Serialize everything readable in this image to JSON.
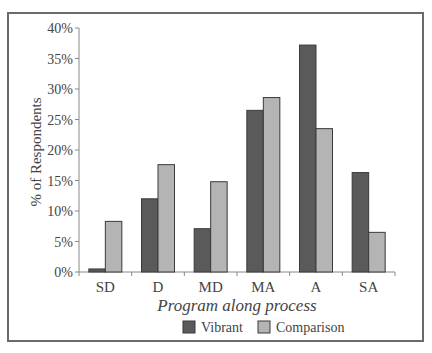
{
  "chart_data": {
    "type": "bar",
    "title": "",
    "xlabel": "Program along process",
    "ylabel": "% of Respondents",
    "categories": [
      "SD",
      "D",
      "MD",
      "MA",
      "A",
      "SA"
    ],
    "series": [
      {
        "name": "Vibrant",
        "color": "#5a5a5a",
        "values": [
          0.5,
          12.0,
          7.1,
          26.5,
          37.2,
          16.3
        ]
      },
      {
        "name": "Comparison",
        "color": "#b4b4b4",
        "values": [
          8.3,
          17.6,
          14.8,
          28.6,
          23.5,
          6.5
        ]
      }
    ],
    "ylim": [
      0,
      40
    ],
    "yticks": [
      "0%",
      "5%",
      "10%",
      "15%",
      "20%",
      "25%",
      "30%",
      "35%",
      "40%"
    ],
    "grid": false,
    "legend_position": "bottom"
  },
  "axis": {
    "y_title": "% of Respondents",
    "x_title": "Program along process"
  },
  "legend": {
    "items": [
      {
        "label": "Vibrant",
        "color": "#5a5a5a"
      },
      {
        "label": "Comparison",
        "color": "#b4b4b4"
      }
    ]
  }
}
